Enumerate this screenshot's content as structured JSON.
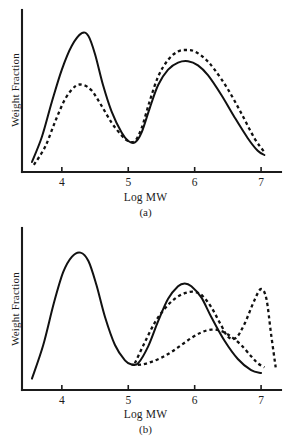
{
  "figure": {
    "panels": [
      {
        "id": "a",
        "subfigure_label": "(a)",
        "xlabel": "Log MW",
        "ylabel": "Weight Fraction",
        "xticks": [
          "4",
          "5",
          "6",
          "7"
        ]
      },
      {
        "id": "b",
        "subfigure_label": "(b)",
        "xlabel": "Log MW",
        "ylabel": "Weight Fraction",
        "xticks": [
          "4",
          "5",
          "6",
          "7"
        ]
      }
    ]
  },
  "chart_data": [
    {
      "type": "line",
      "title": "",
      "subtitle": "(a)",
      "xlabel": "Log MW",
      "ylabel": "Weight Fraction",
      "xlim": [
        3.4,
        7.3
      ],
      "ylim": [
        0,
        1.05
      ],
      "xticks": [
        4,
        5,
        6,
        7
      ],
      "xticklabels": [
        "4",
        "5",
        "6",
        "7"
      ],
      "yticks": [],
      "yticklabels": [],
      "grid": false,
      "legend": "none",
      "series": [
        {
          "name": "solid-curve",
          "style": "solid",
          "x": [
            3.55,
            3.7,
            3.85,
            4.0,
            4.15,
            4.3,
            4.4,
            4.5,
            4.62,
            4.75,
            4.9,
            5.0,
            5.1,
            5.2,
            5.32,
            5.45,
            5.6,
            5.75,
            5.9,
            6.05,
            6.2,
            6.4,
            6.6,
            6.8,
            6.95,
            7.05
          ],
          "y": [
            0.05,
            0.23,
            0.48,
            0.71,
            0.88,
            0.97,
            0.95,
            0.82,
            0.6,
            0.41,
            0.26,
            0.2,
            0.19,
            0.26,
            0.43,
            0.6,
            0.71,
            0.76,
            0.77,
            0.74,
            0.67,
            0.53,
            0.37,
            0.22,
            0.13,
            0.1
          ]
        },
        {
          "name": "dashed-curve",
          "style": "dashed",
          "x": [
            3.58,
            3.75,
            3.9,
            4.05,
            4.2,
            4.32,
            4.45,
            4.6,
            4.75,
            4.9,
            5.0,
            5.1,
            5.2,
            5.32,
            5.45,
            5.6,
            5.75,
            5.88,
            6.0,
            6.15,
            6.3,
            6.5,
            6.7,
            6.9,
            7.05
          ],
          "y": [
            0.03,
            0.16,
            0.34,
            0.5,
            0.59,
            0.6,
            0.56,
            0.45,
            0.33,
            0.24,
            0.2,
            0.2,
            0.29,
            0.48,
            0.66,
            0.78,
            0.84,
            0.85,
            0.84,
            0.79,
            0.71,
            0.57,
            0.4,
            0.22,
            0.12
          ]
        }
      ]
    },
    {
      "type": "line",
      "title": "",
      "subtitle": "(b)",
      "xlabel": "Log MW",
      "ylabel": "Weight Fraction",
      "xlim": [
        3.4,
        7.3
      ],
      "ylim": [
        0,
        1.05
      ],
      "xticks": [
        4,
        5,
        6,
        7
      ],
      "xticklabels": [
        "4",
        "5",
        "6",
        "7"
      ],
      "yticks": [],
      "yticklabels": [],
      "grid": false,
      "legend": "none",
      "series": [
        {
          "name": "solid-curve",
          "style": "solid",
          "x": [
            3.55,
            3.72,
            3.88,
            4.02,
            4.15,
            4.28,
            4.4,
            4.52,
            4.65,
            4.8,
            4.95,
            5.05,
            5.15,
            5.3,
            5.45,
            5.6,
            5.75,
            5.85,
            5.95,
            6.1,
            6.25,
            6.45,
            6.65,
            6.85,
            7.0
          ],
          "y": [
            0.06,
            0.3,
            0.6,
            0.82,
            0.93,
            0.96,
            0.9,
            0.73,
            0.5,
            0.3,
            0.19,
            0.16,
            0.17,
            0.29,
            0.47,
            0.63,
            0.72,
            0.74,
            0.72,
            0.64,
            0.5,
            0.33,
            0.2,
            0.12,
            0.1
          ]
        },
        {
          "name": "dashed-curve-upper",
          "style": "dashed",
          "x": [
            5.1,
            5.25,
            5.4,
            5.55,
            5.7,
            5.85,
            6.0,
            6.12,
            6.25,
            6.4,
            6.5,
            6.62,
            6.75,
            6.9,
            7.0,
            7.08,
            7.15,
            7.22
          ],
          "y": [
            0.17,
            0.32,
            0.46,
            0.56,
            0.63,
            0.67,
            0.68,
            0.65,
            0.57,
            0.44,
            0.36,
            0.35,
            0.45,
            0.62,
            0.7,
            0.63,
            0.38,
            0.14
          ]
        },
        {
          "name": "dashed-curve-lower",
          "style": "dashed",
          "x": [
            5.05,
            5.2,
            5.35,
            5.5,
            5.65,
            5.8,
            5.95,
            6.1,
            6.25,
            6.4,
            6.55,
            6.7,
            6.85,
            6.95,
            7.05
          ],
          "y": [
            0.16,
            0.16,
            0.18,
            0.21,
            0.25,
            0.3,
            0.35,
            0.39,
            0.41,
            0.4,
            0.36,
            0.3,
            0.22,
            0.17,
            0.14
          ]
        }
      ]
    }
  ]
}
